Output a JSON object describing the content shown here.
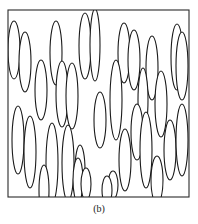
{
  "figure": {
    "label": "(b)",
    "caption_fragment": "· · ·   ·  ·  ·   · · · ·   ·  · · ·  ·  · ·   ·   ·",
    "frame": {
      "x": 8,
      "y": 10,
      "width": 181,
      "height": 187,
      "stroke": "#2a2a2a"
    },
    "grain_stroke": "#1a1a1a",
    "grains": [
      {
        "cx": 14,
        "cy": 50,
        "rx": 6,
        "ry": 29
      },
      {
        "cx": 25,
        "cy": 62,
        "rx": 6,
        "ry": 30
      },
      {
        "cx": 56,
        "cy": 53,
        "rx": 6,
        "ry": 32
      },
      {
        "cx": 85,
        "cy": 46,
        "rx": 6,
        "ry": 33
      },
      {
        "cx": 95,
        "cy": 45,
        "rx": 5,
        "ry": 36
      },
      {
        "cx": 124,
        "cy": 53,
        "rx": 6,
        "ry": 30
      },
      {
        "cx": 134,
        "cy": 60,
        "rx": 6,
        "ry": 30
      },
      {
        "cx": 152,
        "cy": 68,
        "rx": 6,
        "ry": 32
      },
      {
        "cx": 177,
        "cy": 57,
        "rx": 6,
        "ry": 33
      },
      {
        "cx": 182,
        "cy": 66,
        "rx": 6,
        "ry": 34
      },
      {
        "cx": 41,
        "cy": 90,
        "rx": 6,
        "ry": 30
      },
      {
        "cx": 62,
        "cy": 94,
        "rx": 6,
        "ry": 33
      },
      {
        "cx": 72,
        "cy": 96,
        "rx": 6,
        "ry": 33
      },
      {
        "cx": 116,
        "cy": 100,
        "rx": 6,
        "ry": 40
      },
      {
        "cx": 143,
        "cy": 100,
        "rx": 5,
        "ry": 32
      },
      {
        "cx": 161,
        "cy": 104,
        "rx": 6,
        "ry": 33
      },
      {
        "cx": 100,
        "cy": 120,
        "rx": 6,
        "ry": 28
      },
      {
        "cx": 137,
        "cy": 132,
        "rx": 6,
        "ry": 28
      },
      {
        "cx": 18,
        "cy": 140,
        "rx": 6,
        "ry": 34
      },
      {
        "cx": 30,
        "cy": 152,
        "rx": 6,
        "ry": 36
      },
      {
        "cx": 52,
        "cy": 163,
        "rx": 6,
        "ry": 40
      },
      {
        "cx": 68,
        "cy": 163,
        "rx": 6,
        "ry": 38
      },
      {
        "cx": 80,
        "cy": 170,
        "rx": 5,
        "ry": 25
      },
      {
        "cx": 78,
        "cy": 180,
        "rx": 5,
        "ry": 22
      },
      {
        "cx": 86,
        "cy": 184,
        "rx": 5,
        "ry": 16
      },
      {
        "cx": 113,
        "cy": 185,
        "rx": 5,
        "ry": 14
      },
      {
        "cx": 107,
        "cy": 190,
        "rx": 5,
        "ry": 14
      },
      {
        "cx": 125,
        "cy": 160,
        "rx": 6,
        "ry": 31
      },
      {
        "cx": 146,
        "cy": 150,
        "rx": 6,
        "ry": 38
      },
      {
        "cx": 157,
        "cy": 180,
        "rx": 6,
        "ry": 24
      },
      {
        "cx": 170,
        "cy": 150,
        "rx": 6,
        "ry": 30
      },
      {
        "cx": 182,
        "cy": 140,
        "rx": 6,
        "ry": 36
      },
      {
        "cx": 44,
        "cy": 190,
        "rx": 5,
        "ry": 25
      }
    ]
  }
}
